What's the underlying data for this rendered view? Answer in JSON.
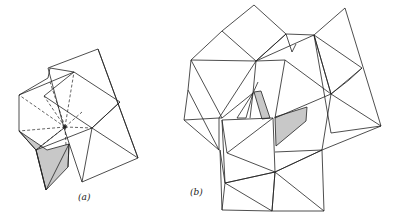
{
  "figure": {
    "panels": [
      {
        "id": "a",
        "label": "(a)"
      },
      {
        "id": "b",
        "label": "(b)"
      }
    ],
    "colors": {
      "line": "#222222",
      "shade": "#c8c8c8",
      "background": "#ffffff"
    }
  }
}
